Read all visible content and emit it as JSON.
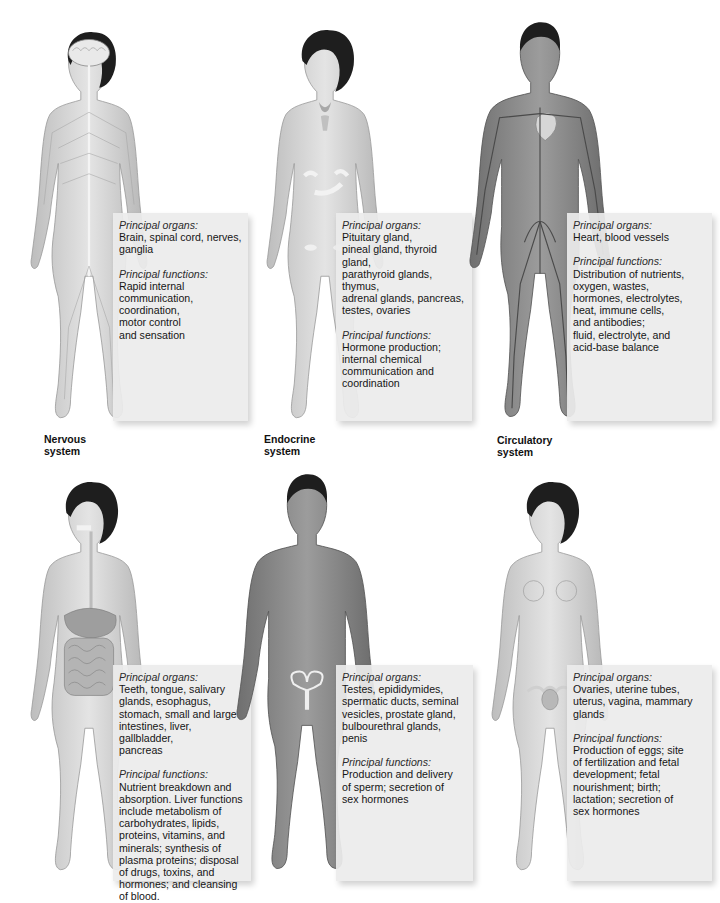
{
  "figure": {
    "systems": [
      {
        "id": "nervous",
        "label": "Nervous system",
        "organs_heading": "Principal organs:",
        "organs": "Brain, spinal cord, nerves,\nganglia",
        "functions_heading": "Principal functions:",
        "functions": "Rapid internal\ncommunication,\ncoordination,\nmotor control\nand sensation",
        "figure_sex": "female",
        "highlight": "brain, spinal cord, nerves"
      },
      {
        "id": "endocrine",
        "label": "Endocrine system",
        "organs_heading": "Principal organs:",
        "organs": "Pituitary gland,\npineal gland, thyroid gland,\nparathyroid glands, thymus,\nadrenal glands, pancreas,\ntestes, ovaries",
        "functions_heading": "Principal functions:",
        "functions": "Hormone production;\ninternal chemical\ncommunication and\ncoordination",
        "figure_sex": "female",
        "highlight": "thyroid, thymus, adrenals, pancreas, ovaries"
      },
      {
        "id": "circulatory",
        "label": "Circulatory system",
        "organs_heading": "Principal organs:",
        "organs": "Heart, blood vessels",
        "functions_heading": "Principal functions:",
        "functions": "Distribution of nutrients,\noxygen, wastes,\nhormones, electrolytes,\nheat, immune cells,\nand antibodies;\nfluid, electrolyte, and\nacid-base balance",
        "figure_sex": "male",
        "highlight": "heart, blood vessels"
      },
      {
        "id": "digestive",
        "label": "",
        "organs_heading": "Principal organs:",
        "organs": "Teeth, tongue, salivary\nglands, esophagus,\nstomach, small and large\nintestines, liver, gallbladder,\npancreas",
        "functions_heading": "Principal functions:",
        "functions": "Nutrient breakdown and\nabsorption. Liver functions\ninclude metabolism of\ncarbohydrates, lipids,\nproteins, vitamins, and\nminerals; synthesis of\nplasma proteins; disposal\nof drugs, toxins, and\nhormones; and cleansing\nof blood.",
        "figure_sex": "female",
        "highlight": "esophagus, stomach, intestines"
      },
      {
        "id": "male-reproductive",
        "label": "",
        "organs_heading": "Principal organs:",
        "organs": "Testes, epididymides,\nspermatic ducts, seminal\nvesicles, prostate gland,\nbulbourethral glands,\npenis",
        "functions_heading": "Principal functions:",
        "functions": "Production and delivery\nof sperm; secretion of\nsex hormones",
        "figure_sex": "male",
        "highlight": "male reproductive organs"
      },
      {
        "id": "female-reproductive",
        "label": "",
        "organs_heading": "Principal organs:",
        "organs": "Ovaries, uterine tubes,\nuterus, vagina, mammary\nglands",
        "functions_heading": "Principal functions:",
        "functions": "Production of eggs; site\nof fertilization and fetal\ndevelopment; fetal\nnourishment; birth;\nlactation; secretion of\nsex hormones",
        "figure_sex": "female",
        "highlight": "uterus, ovaries, mammary glands"
      }
    ]
  },
  "colors": {
    "background": "#ffffff",
    "panel": "#ececec",
    "skin_light": "#d9d9d9",
    "skin_dark": "#8a8a8a",
    "hair": "#1e1e1e",
    "text": "#151515"
  }
}
